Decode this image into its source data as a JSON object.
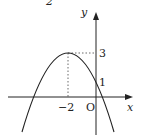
{
  "figure": {
    "top_fragment": "2",
    "axes": {
      "x_label": "x",
      "y_label": "y",
      "origin_label": "O"
    },
    "tick_labels": {
      "x_vertex": "−2",
      "y_vertex": "3",
      "y_intercept": "1"
    },
    "curve": "downward parabola with vertex (−2, 3) passing through (0, 1)",
    "colors": {
      "stroke": "#222222",
      "background": "#ffffff"
    }
  }
}
